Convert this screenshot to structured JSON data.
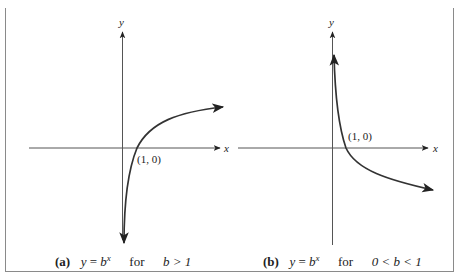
{
  "figure": {
    "panels": [
      {
        "id": "a",
        "axis_labels": {
          "x": "x",
          "y": "y"
        },
        "point_label": "(1, 0)",
        "caption": {
          "tag": "(a)",
          "equation_lhs": "y",
          "equation_eq": "=",
          "equation_base": "b",
          "equation_exp": "x",
          "for": "for",
          "condition": "b > 1"
        }
      },
      {
        "id": "b",
        "axis_labels": {
          "x": "x",
          "y": "y"
        },
        "point_label": "(1, 0)",
        "caption": {
          "tag": "(b)",
          "equation_lhs": "y",
          "equation_eq": "=",
          "equation_base": "b",
          "equation_exp": "x",
          "for": "for",
          "condition": "0 < b < 1"
        }
      }
    ],
    "colors": {
      "axis": "#555555",
      "curve": "#333333",
      "border": "#8a8a8a"
    }
  }
}
